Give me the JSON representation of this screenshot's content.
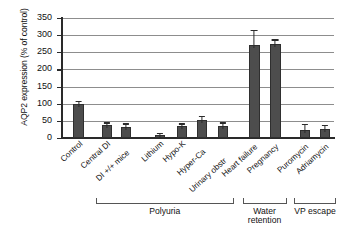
{
  "chart_data": {
    "type": "bar",
    "title": "",
    "xlabel": "",
    "ylabel": "AQP2 expression (% of control)",
    "ylim": [
      0,
      350
    ],
    "yticks": [
      0,
      50,
      100,
      150,
      200,
      250,
      300,
      350
    ],
    "grid": true,
    "legend": "none",
    "bar_color": "#4d4d4d",
    "categories": [
      "Control",
      "Central DI",
      "DI +/+ mice",
      "Lithium",
      "Hypo-K",
      "Hyper-Ca",
      "Urinary obstr",
      "Heart failure",
      "Pregnancy",
      "Puromycin",
      "Adriamycin"
    ],
    "values": [
      100,
      38,
      33,
      8,
      35,
      53,
      36,
      272,
      274,
      24,
      27
    ],
    "errors": [
      5,
      4,
      6,
      3,
      4,
      7,
      6,
      40,
      10,
      14,
      7
    ],
    "groups": [
      {
        "label": "Polyuria",
        "from": 1,
        "to": 6
      },
      {
        "label": "Water retention",
        "from": 7,
        "to": 8
      },
      {
        "label": "VP escape",
        "from": 9,
        "to": 10
      }
    ]
  },
  "axis": {
    "y_title": "AQP2 expression (% of control)",
    "tick_labels": [
      "0",
      "50",
      "100",
      "150",
      "200",
      "250",
      "300",
      "350"
    ]
  },
  "groups_text": {
    "polyuria": "Polyuria",
    "water_retention_line1": "Water",
    "water_retention_line2": "retention",
    "vp_escape": "VP escape"
  }
}
